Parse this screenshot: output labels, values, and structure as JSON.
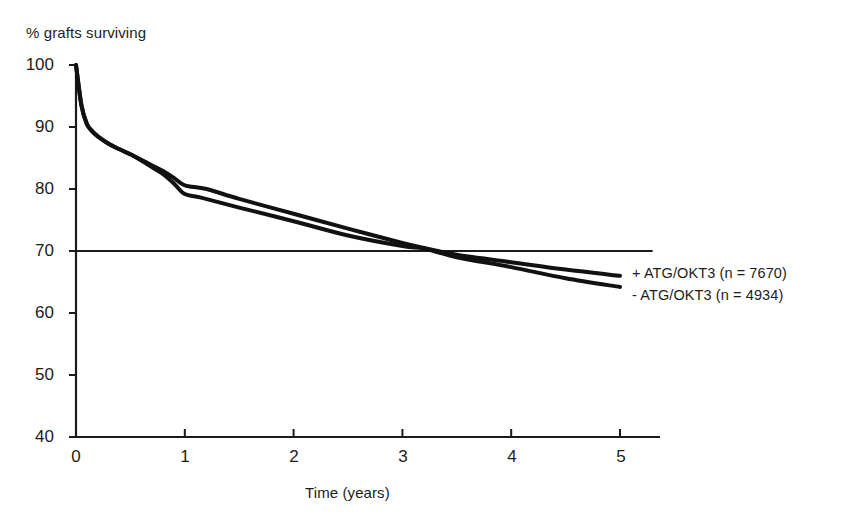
{
  "chart_data": {
    "type": "line",
    "title": "",
    "ylabel": "% grafts surviving",
    "xlabel": "Time (years)",
    "xlim": [
      0,
      5
    ],
    "ylim": [
      40,
      100
    ],
    "xticks": [
      0,
      1,
      2,
      3,
      4,
      5
    ],
    "yticks": [
      40,
      50,
      60,
      70,
      80,
      90,
      100
    ],
    "xtick_labels": [
      "0",
      "1",
      "2",
      "3",
      "4",
      "5"
    ],
    "ytick_labels": [
      "40",
      "50",
      "60",
      "70",
      "80",
      "90",
      "100"
    ],
    "grid": false,
    "legend_position": "right",
    "reference_lines": [
      {
        "name": "70-percent-line",
        "orientation": "horizontal",
        "y": 70,
        "x_start": 0,
        "x_end": 5.3
      }
    ],
    "series": [
      {
        "name": "+ ATG/OKT3 (n = 7670)",
        "label": "+ ATG/OKT3 (n = 7670)",
        "group": "plus",
        "n": 7670,
        "color": "#111111",
        "x": [
          0,
          0.05,
          0.1,
          0.15,
          0.2,
          0.3,
          0.4,
          0.5,
          0.6,
          0.7,
          0.8,
          0.9,
          1.0,
          1.2,
          1.5,
          2.0,
          2.5,
          3.0,
          3.2,
          3.5,
          4.0,
          4.5,
          5.0
        ],
        "y": [
          100,
          93.5,
          90.5,
          89.3,
          88.5,
          87.3,
          86.4,
          85.6,
          84.7,
          83.8,
          82.9,
          81.8,
          80.6,
          80.0,
          78.4,
          76.0,
          73.6,
          71.3,
          70.5,
          69.4,
          68.2,
          67.0,
          66.0
        ]
      },
      {
        "name": "- ATG/OKT3 (n = 4934)",
        "label": "- ATG/OKT3 (n = 4934)",
        "group": "minus",
        "n": 4934,
        "color": "#111111",
        "x": [
          0,
          0.05,
          0.1,
          0.15,
          0.2,
          0.3,
          0.4,
          0.5,
          0.6,
          0.7,
          0.8,
          0.9,
          1.0,
          1.15,
          1.5,
          2.0,
          2.5,
          3.0,
          3.2,
          3.5,
          4.0,
          4.5,
          5.0
        ],
        "y": [
          100,
          93.5,
          90.5,
          89.3,
          88.5,
          87.3,
          86.4,
          85.6,
          84.6,
          83.5,
          82.4,
          80.9,
          79.2,
          78.6,
          77.0,
          74.8,
          72.5,
          70.8,
          70.4,
          69.0,
          67.4,
          65.6,
          64.2
        ]
      }
    ]
  },
  "chart": {
    "ylabel": "% grafts surviving",
    "xlabel": "Time (years)",
    "yticks": [
      "100",
      "90",
      "80",
      "70",
      "60",
      "50",
      "40"
    ],
    "xticks": [
      "0",
      "1",
      "2",
      "3",
      "4",
      "5"
    ],
    "legend": {
      "plus": "+ ATG/OKT3 (n = 7670)",
      "minus": "- ATG/OKT3 (n = 4934)"
    }
  }
}
